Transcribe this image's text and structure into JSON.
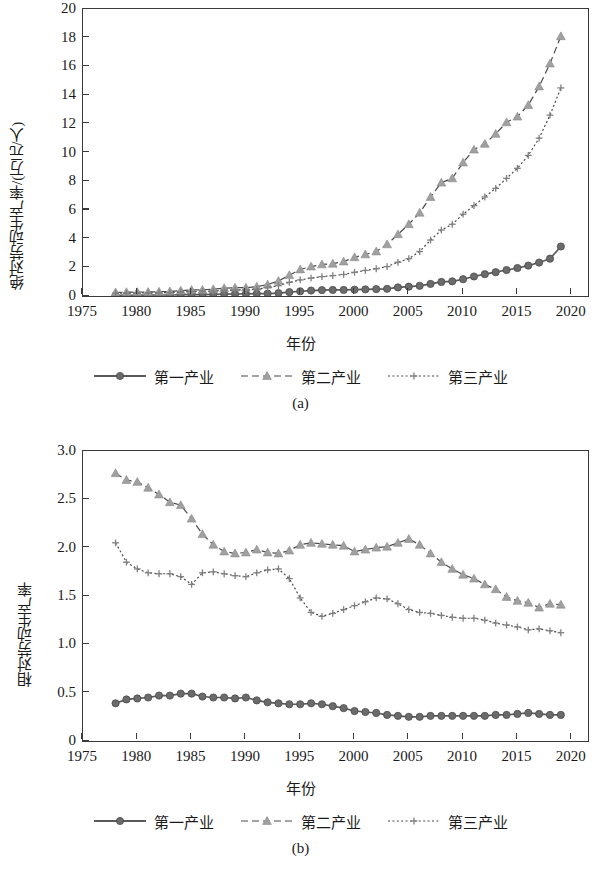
{
  "figure": {
    "panels": [
      {
        "id": "a",
        "sublabel": "(a)",
        "ylabel": "绝对劳动生产率/(万元/人)",
        "xlabel": "年份",
        "yticks": [
          "0",
          "2",
          "4",
          "6",
          "8",
          "10",
          "12",
          "14",
          "16",
          "18",
          "20"
        ],
        "xticks": [
          "1975",
          "1980",
          "1985",
          "1990",
          "1995",
          "2000",
          "2005",
          "2010",
          "2015",
          "2020"
        ]
      },
      {
        "id": "b",
        "sublabel": "(b)",
        "ylabel": "相对劳动生产率",
        "xlabel": "年份",
        "yticks": [
          "0",
          "0.5",
          "1.0",
          "1.5",
          "2.0",
          "2.5",
          "3.0"
        ],
        "xticks": [
          "1975",
          "1980",
          "1985",
          "1990",
          "1995",
          "2000",
          "2005",
          "2010",
          "2015",
          "2020"
        ]
      }
    ],
    "legend": [
      {
        "label": "第一产业",
        "style": "solid",
        "marker": "circle",
        "color": "#6b6b6b"
      },
      {
        "label": "第二产业",
        "style": "dashed",
        "marker": "triangle",
        "color": "#a0a0a0"
      },
      {
        "label": "第三产业",
        "style": "dotted",
        "marker": "plus",
        "color": "#808080"
      }
    ]
  },
  "chart_data": [
    {
      "type": "line",
      "panel": "a",
      "title": "",
      "xlabel": "年份",
      "ylabel": "绝对劳动生产率/(万元/人)",
      "xlim": [
        1975,
        2021.5
      ],
      "ylim": [
        0,
        20
      ],
      "grid": false,
      "legend_position": "below",
      "x": [
        1978,
        1979,
        1980,
        1981,
        1982,
        1983,
        1984,
        1985,
        1986,
        1987,
        1988,
        1989,
        1990,
        1991,
        1992,
        1993,
        1994,
        1995,
        1996,
        1997,
        1998,
        1999,
        2000,
        2001,
        2002,
        2003,
        2004,
        2005,
        2006,
        2007,
        2008,
        2009,
        2010,
        2011,
        2012,
        2013,
        2014,
        2015,
        2016,
        2017,
        2018,
        2019
      ],
      "series": [
        {
          "name": "第一产业",
          "marker": "circle",
          "style": "solid",
          "color": "#6b6b6b",
          "values": [
            0.04,
            0.05,
            0.05,
            0.06,
            0.07,
            0.07,
            0.09,
            0.1,
            0.1,
            0.11,
            0.13,
            0.14,
            0.15,
            0.16,
            0.17,
            0.2,
            0.27,
            0.33,
            0.38,
            0.41,
            0.42,
            0.42,
            0.44,
            0.46,
            0.48,
            0.5,
            0.6,
            0.65,
            0.71,
            0.84,
            0.98,
            1.02,
            1.17,
            1.36,
            1.52,
            1.66,
            1.81,
            1.95,
            2.12,
            2.33,
            2.6,
            3.45
          ]
        },
        {
          "name": "第二产业",
          "marker": "triangle",
          "style": "dashed",
          "color": "#a0a0a0",
          "values": [
            0.25,
            0.27,
            0.28,
            0.28,
            0.3,
            0.32,
            0.37,
            0.42,
            0.43,
            0.47,
            0.55,
            0.58,
            0.58,
            0.65,
            0.8,
            1.05,
            1.45,
            1.85,
            2.05,
            2.2,
            2.25,
            2.4,
            2.7,
            2.9,
            3.1,
            3.6,
            4.3,
            5.0,
            5.8,
            6.9,
            7.9,
            8.2,
            9.3,
            10.2,
            10.6,
            11.3,
            12.1,
            12.5,
            13.3,
            14.6,
            16.2,
            18.1
          ]
        },
        {
          "name": "第三产业",
          "marker": "plus",
          "style": "dotted",
          "color": "#808080",
          "values": [
            0.19,
            0.2,
            0.21,
            0.22,
            0.23,
            0.24,
            0.28,
            0.31,
            0.32,
            0.34,
            0.4,
            0.42,
            0.43,
            0.48,
            0.58,
            0.72,
            0.95,
            1.12,
            1.25,
            1.35,
            1.42,
            1.5,
            1.65,
            1.78,
            1.9,
            2.05,
            2.35,
            2.6,
            3.1,
            3.9,
            4.6,
            5.0,
            5.7,
            6.3,
            6.9,
            7.5,
            8.2,
            8.9,
            9.8,
            11.0,
            12.6,
            14.5
          ]
        }
      ]
    },
    {
      "type": "line",
      "panel": "b",
      "title": "",
      "xlabel": "年份",
      "ylabel": "相对劳动生产率",
      "xlim": [
        1975,
        2021.5
      ],
      "ylim": [
        0,
        3.0
      ],
      "grid": false,
      "legend_position": "below",
      "x": [
        1978,
        1979,
        1980,
        1981,
        1982,
        1983,
        1984,
        1985,
        1986,
        1987,
        1988,
        1989,
        1990,
        1991,
        1992,
        1993,
        1994,
        1995,
        1996,
        1997,
        1998,
        1999,
        2000,
        2001,
        2002,
        2003,
        2004,
        2005,
        2006,
        2007,
        2008,
        2009,
        2010,
        2011,
        2012,
        2013,
        2014,
        2015,
        2016,
        2017,
        2018,
        2019
      ],
      "series": [
        {
          "name": "第一产业",
          "marker": "circle",
          "style": "solid",
          "color": "#6b6b6b",
          "values": [
            0.39,
            0.43,
            0.44,
            0.45,
            0.47,
            0.47,
            0.49,
            0.49,
            0.46,
            0.45,
            0.45,
            0.44,
            0.45,
            0.42,
            0.4,
            0.39,
            0.38,
            0.38,
            0.39,
            0.38,
            0.36,
            0.34,
            0.31,
            0.3,
            0.29,
            0.27,
            0.26,
            0.25,
            0.25,
            0.26,
            0.26,
            0.26,
            0.26,
            0.26,
            0.26,
            0.27,
            0.27,
            0.28,
            0.29,
            0.28,
            0.27,
            0.27
          ]
        },
        {
          "name": "第二产业",
          "marker": "triangle",
          "style": "dashed",
          "color": "#a0a0a0",
          "values": [
            2.77,
            2.7,
            2.68,
            2.62,
            2.55,
            2.47,
            2.44,
            2.3,
            2.14,
            2.03,
            1.96,
            1.94,
            1.95,
            1.98,
            1.95,
            1.94,
            1.97,
            2.03,
            2.05,
            2.04,
            2.03,
            2.02,
            1.96,
            1.98,
            2.0,
            2.01,
            2.05,
            2.09,
            2.03,
            1.94,
            1.85,
            1.78,
            1.72,
            1.68,
            1.62,
            1.57,
            1.49,
            1.45,
            1.43,
            1.38,
            1.42,
            1.41
          ]
        },
        {
          "name": "第三产业",
          "marker": "plus",
          "style": "dotted",
          "color": "#808080",
          "values": [
            2.05,
            1.85,
            1.78,
            1.74,
            1.73,
            1.73,
            1.7,
            1.62,
            1.74,
            1.75,
            1.73,
            1.71,
            1.7,
            1.74,
            1.77,
            1.78,
            1.68,
            1.48,
            1.33,
            1.29,
            1.32,
            1.36,
            1.4,
            1.44,
            1.48,
            1.47,
            1.42,
            1.36,
            1.33,
            1.32,
            1.3,
            1.28,
            1.27,
            1.27,
            1.25,
            1.22,
            1.2,
            1.18,
            1.15,
            1.16,
            1.14,
            1.12
          ]
        }
      ]
    }
  ]
}
